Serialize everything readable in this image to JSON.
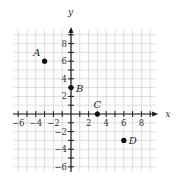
{
  "chart_data": {
    "type": "scatter",
    "title": "",
    "xlabel": "x",
    "ylabel": "y",
    "xlim": [
      -7,
      10
    ],
    "ylim": [
      -7,
      10
    ],
    "grid": true,
    "grid_step": 1,
    "x_ticks": [
      -6,
      -4,
      -2,
      2,
      4,
      6,
      8
    ],
    "y_ticks": [
      -6,
      -4,
      -2,
      2,
      4,
      6,
      8
    ],
    "x_tick_labels": [
      "−6",
      "−4",
      "−2",
      "2",
      "4",
      "6",
      "8"
    ],
    "y_tick_labels": [
      "−6",
      "−4",
      "−2",
      "2",
      "4",
      "6",
      "8"
    ],
    "points": [
      {
        "label": "A",
        "x": -3,
        "y": 6,
        "label_pos": "upper-left"
      },
      {
        "label": "B",
        "x": 0,
        "y": 3,
        "label_pos": "right"
      },
      {
        "label": "C",
        "x": 3,
        "y": 0,
        "label_pos": "above"
      },
      {
        "label": "D",
        "x": 6,
        "y": -3,
        "label_pos": "right"
      }
    ],
    "legend": null
  }
}
